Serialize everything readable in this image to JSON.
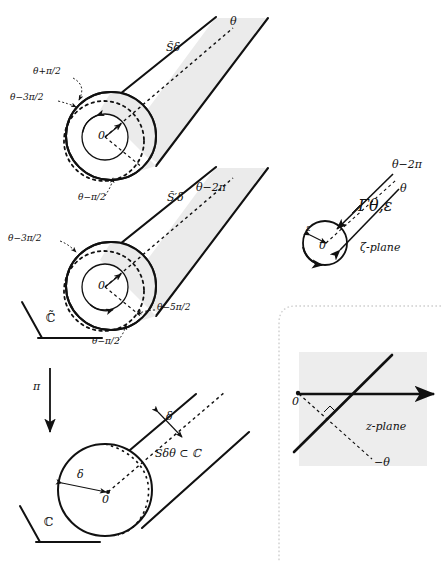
{
  "figure": {
    "colors": {
      "stroke": "#111111",
      "shade": "#ebebeb",
      "shade_z": "#ededed",
      "dotted_border": "#cfcfcf"
    }
  },
  "panel_top": {
    "name": "C-tilde plane panel",
    "sector_upper_label": "S̃δ",
    "sector_lower_label": "S̃′δ",
    "axis_upper_label": "θ",
    "axis_lower_label": "θ−2π",
    "origin_label_upper": "0",
    "origin_label_lower": "0",
    "plane_label": "ℂ̃",
    "callouts_upper": [
      "θ+π/2",
      "θ−3π/2",
      "θ−π/2"
    ],
    "callouts_lower": [
      "θ−3π/2",
      "θ−5π/2",
      "θ−π/2"
    ]
  },
  "panel_zeta": {
    "name": "zeta plane panel",
    "plane_label": "ζ-plane",
    "contour_label": "Γθ,ε",
    "radius_label": "ε",
    "origin_label": "0",
    "ray_upper_label": "θ−2π",
    "ray_lower_label": "θ"
  },
  "panel_z": {
    "name": "z plane panel",
    "plane_label": "z-plane",
    "origin_label": "0",
    "angle_label": "−θ"
  },
  "panel_bottom": {
    "name": "C plane panel",
    "map_arrow_label": "π",
    "sector_label": "Sδθ ⊂ ℂ",
    "radius_label_side": "δ",
    "radius_label_base": "δ",
    "origin_label": "0",
    "plane_label": "ℂ"
  }
}
